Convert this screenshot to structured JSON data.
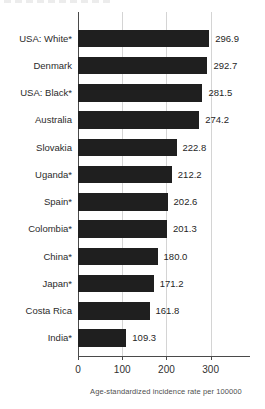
{
  "chart_data": {
    "type": "bar",
    "orientation": "horizontal",
    "categories": [
      "USA: White*",
      "Denmark",
      "USA: Black*",
      "Australia",
      "Slovakia",
      "Uganda*",
      "Spain*",
      "Colombia*",
      "China*",
      "Japan*",
      "Costa Rica",
      "India*"
    ],
    "values": [
      296.9,
      292.7,
      281.5,
      274.2,
      222.8,
      212.2,
      202.6,
      201.3,
      180.0,
      171.2,
      161.8,
      109.3
    ],
    "value_labels": [
      "296.9",
      "292.7",
      "281.5",
      "274.2",
      "222.8",
      "212.2",
      "202.6",
      "201.3",
      "180.0",
      "171.2",
      "161.8",
      "109.3"
    ],
    "xticks": [
      0,
      100,
      200,
      300
    ],
    "xtick_labels": [
      "0",
      "100",
      "200",
      "300"
    ],
    "xlim": [
      0,
      389
    ],
    "xlabel": "Age-standardized incidence rate per 100000",
    "title": "",
    "grid": "vertical-gridlines-at-ticks",
    "legend": "none",
    "bar_color": "#1f1f1f",
    "gridline_color": "#d4d4d4",
    "axis_color": "#4a4a4a"
  }
}
